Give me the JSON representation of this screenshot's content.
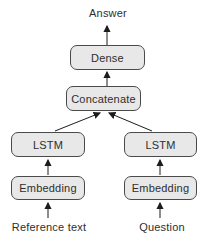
{
  "diagram": {
    "type": "neural-network-architecture",
    "output_label": "Answer",
    "nodes": {
      "dense": "Dense",
      "concatenate": "Concatenate",
      "lstm_left": "LSTM",
      "lstm_right": "LSTM",
      "embedding_left": "Embedding",
      "embedding_right": "Embedding"
    },
    "inputs": {
      "left": "Reference text",
      "right": "Question"
    },
    "edges": [
      "reference_text -> embedding_left",
      "question -> embedding_right",
      "embedding_left -> lstm_left",
      "embedding_right -> lstm_right",
      "lstm_left -> concatenate",
      "lstm_right -> concatenate",
      "concatenate -> dense",
      "dense -> answer"
    ],
    "colors": {
      "node_fill": "#e8e8e8",
      "node_border": "#4a4a4a",
      "arrow": "#1c1c1c",
      "text": "#2e2e2e",
      "background": "#ffffff"
    }
  }
}
